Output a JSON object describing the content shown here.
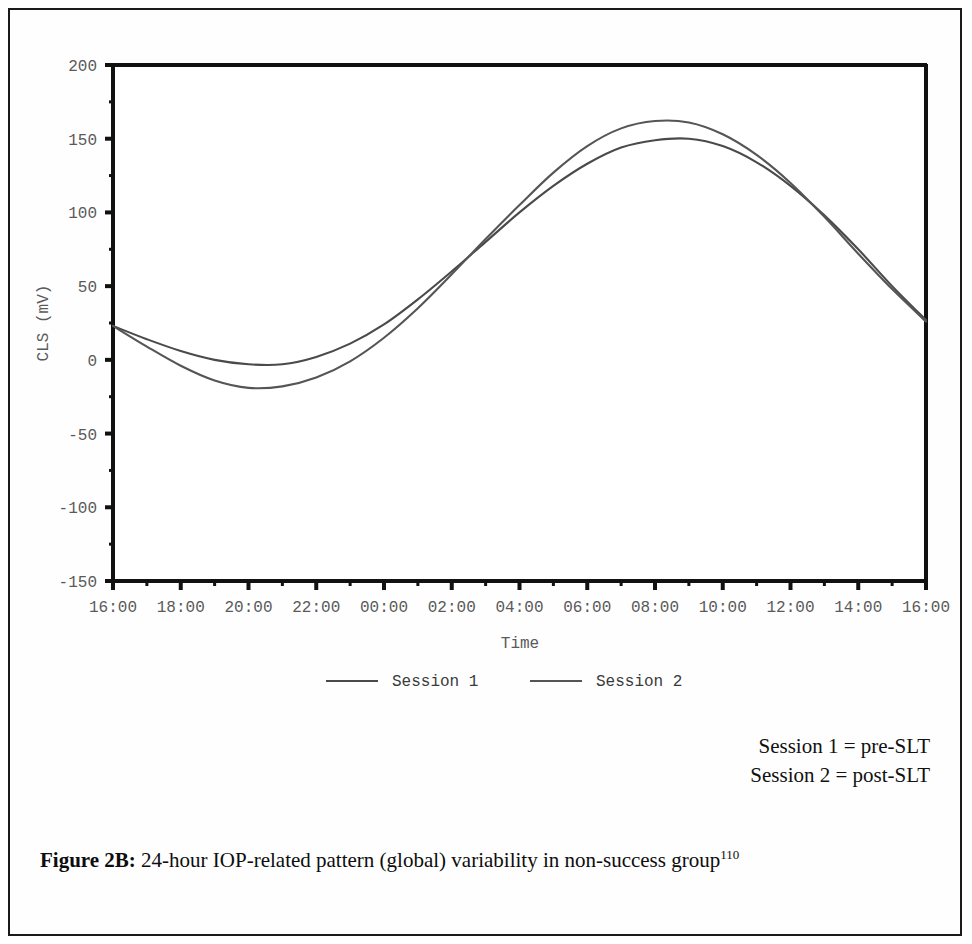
{
  "figure": {
    "caption_label": "Figure 2B:",
    "caption_text": " 24-hour IOP-related pattern (global) variability in non-success group",
    "caption_ref": "110"
  },
  "notes": {
    "line1": "Session 1 = pre-SLT",
    "line2": "Session 2 = post-SLT"
  },
  "chart_data": {
    "type": "line",
    "title": "",
    "xlabel": "Time",
    "ylabel": "CLS  (mV)",
    "ylim": [
      -150,
      200
    ],
    "yticks": [
      200,
      150,
      100,
      50,
      0,
      -50,
      -100,
      -150
    ],
    "ytick_labels": [
      "200",
      "150",
      "100",
      "50",
      "0",
      "-50",
      "-100",
      "-150"
    ],
    "xticks": [
      0,
      2,
      4,
      6,
      8,
      10,
      12,
      14,
      16,
      18,
      20,
      22,
      24
    ],
    "xtick_labels": [
      "16:00",
      "18:00",
      "20:00",
      "22:00",
      "00:00",
      "02:00",
      "04:00",
      "06:00",
      "08:00",
      "10:00",
      "12:00",
      "14:00",
      "16:00"
    ],
    "xlim": [
      0,
      24
    ],
    "grid": false,
    "legend_position": "below-axis",
    "x": [
      0,
      1,
      2,
      3,
      4,
      5,
      6,
      7,
      8,
      9,
      10,
      11,
      12,
      13,
      14,
      15,
      16,
      17,
      18,
      19,
      20,
      21,
      22,
      23,
      24
    ],
    "series": [
      {
        "name": "Session 1",
        "color": "#4a4a4a",
        "values": [
          23,
          14,
          6,
          0,
          -3,
          -3,
          2,
          11,
          24,
          41,
          60,
          80,
          100,
          118,
          133,
          144,
          149,
          150,
          145,
          134,
          118,
          98,
          75,
          50,
          27
        ]
      },
      {
        "name": "Session 2",
        "color": "#555555",
        "values": [
          23,
          9,
          -4,
          -14,
          -19,
          -18,
          -12,
          -1,
          15,
          35,
          58,
          82,
          105,
          127,
          145,
          157,
          162,
          161,
          153,
          139,
          120,
          97,
          72,
          48,
          26
        ]
      }
    ]
  },
  "legend": {
    "items": [
      {
        "label": "Session 1"
      },
      {
        "label": "Session 2"
      }
    ]
  },
  "colors": {
    "frame": "#1a1a1a",
    "axis": "#111111",
    "tick_text": "#5a5a5a",
    "page_bg": "#ffffff"
  }
}
